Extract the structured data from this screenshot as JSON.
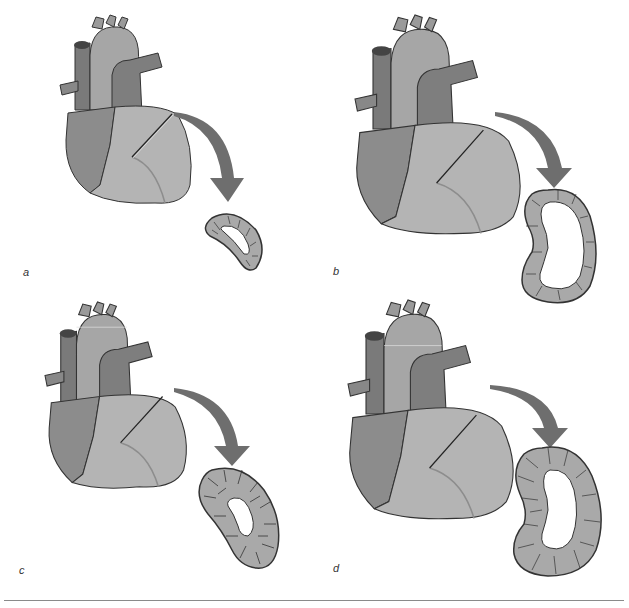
{
  "figure": {
    "panels": [
      {
        "id": "a",
        "label": "a",
        "heart_scale": 1.0,
        "wall": "thin",
        "cavity": "normal"
      },
      {
        "id": "b",
        "label": "b",
        "heart_scale": 1.2,
        "wall": "thin",
        "cavity": "dilated"
      },
      {
        "id": "c",
        "label": "c",
        "heart_scale": 1.05,
        "wall": "thick",
        "cavity": "small"
      },
      {
        "id": "d",
        "label": "d",
        "heart_scale": 1.2,
        "wall": "thick",
        "cavity": "dilated"
      }
    ],
    "colors": {
      "ventricle": "#b4b4b4",
      "atrium": "#8c8c8c",
      "aorta": "#a8a8a8",
      "pulmonary": "#7e7e7e",
      "arrow": "#6e6e6e",
      "outline": "#3a3a3a",
      "cell_fill": "#a9a9a9",
      "divider": "#8a8a8a"
    }
  }
}
